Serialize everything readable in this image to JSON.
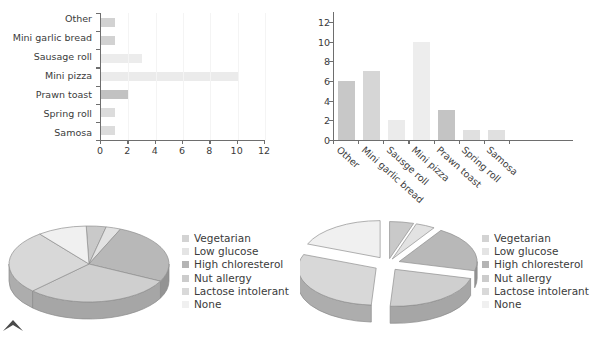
{
  "chart_data": [
    {
      "id": "horizontal-bar",
      "type": "bar",
      "orientation": "horizontal",
      "title": "",
      "xlabel": "",
      "ylabel": "",
      "categories": [
        "Other",
        "Mini garlic bread",
        "Sausage roll",
        "Mini pizza",
        "Prawn toast",
        "Spring roll",
        "Samosa"
      ],
      "values": [
        1,
        1,
        3,
        10,
        2,
        1,
        1
      ],
      "bar_colors": [
        "#d2d2d2",
        "#d2d2d2",
        "#ececec",
        "#ebebeb",
        "#c2c2c2",
        "#dcdcdc",
        "#dcdcdc"
      ],
      "xlim": [
        0,
        12
      ],
      "xticks": [
        0,
        2,
        4,
        6,
        8,
        10,
        12
      ],
      "xticklabels": [
        "0",
        "2",
        "4",
        "6",
        "8",
        "10",
        "12"
      ],
      "grid": true,
      "legend": "none"
    },
    {
      "id": "vertical-bar",
      "type": "bar",
      "orientation": "vertical",
      "title": "",
      "xlabel": "",
      "ylabel": "",
      "categories": [
        "Other",
        "Mini garlic bread",
        "Sausge roll",
        "Mini pizza",
        "Prawn toast",
        "Spring roll",
        "Samosa"
      ],
      "values": [
        6,
        7,
        2,
        10,
        3,
        1,
        1
      ],
      "bar_colors": [
        "#c8c8c8",
        "#d6d6d6",
        "#ebebeb",
        "#ededed",
        "#c4c4c4",
        "#e0e0e0",
        "#e0e0e0"
      ],
      "ylim": [
        0,
        13
      ],
      "yticks": [
        0,
        2,
        4,
        6,
        8,
        10,
        12
      ],
      "yticklabels": [
        "0",
        "2",
        "4",
        "6",
        "8",
        "10",
        "12"
      ],
      "grid": true,
      "legend": "none"
    },
    {
      "id": "pie-left",
      "type": "pie",
      "style": "3d",
      "exploded": false,
      "title": "",
      "labels": [
        "Vegetarian",
        "Low glucose",
        "High chloresterol",
        "Nut allergy",
        "Lactose intolerant",
        "None"
      ],
      "values": [
        4,
        3,
        26,
        30,
        27,
        10
      ],
      "slice_colors": [
        "#c9c9c9",
        "#e2e2e2",
        "#b8b8b8",
        "#cfcfcf",
        "#d8d8d8",
        "#f0f0f0"
      ],
      "legend_position": "right"
    },
    {
      "id": "pie-right",
      "type": "pie",
      "style": "3d",
      "exploded": true,
      "title": "",
      "labels": [
        "Vegetarian",
        "Low glucose",
        "High chloresterol",
        "Nut allergy",
        "Lactose intolerant",
        "None"
      ],
      "values": [
        5,
        4,
        20,
        22,
        30,
        19
      ],
      "slice_colors": [
        "#c9c9c9",
        "#e2e2e2",
        "#b8b8b8",
        "#cfcfcf",
        "#d8d8d8",
        "#f0f0f0"
      ],
      "legend_position": "right"
    }
  ],
  "legend": {
    "items": [
      {
        "label": "Vegetarian",
        "color": "#d3d3d3"
      },
      {
        "label": "Low glucose",
        "color": "#e4e4e4"
      },
      {
        "label": "High chloresterol",
        "color": "#b4b4b4"
      },
      {
        "label": "Nut allergy",
        "color": "#cccccc"
      },
      {
        "label": "Lactose intolerant",
        "color": "#d9d9d9"
      },
      {
        "label": "None",
        "color": "#f0f0f0"
      }
    ]
  },
  "icons": {
    "corner_mark": "caret-up-icon"
  },
  "colors": {
    "axis": "#6e6e6e",
    "text": "#3b3b3b",
    "grid": "#f4f4f4",
    "background": "#ffffff"
  }
}
